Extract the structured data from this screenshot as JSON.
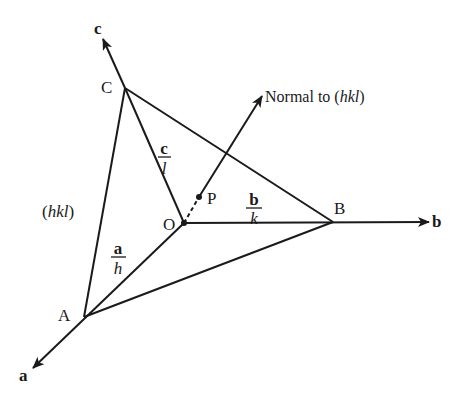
{
  "diagram": {
    "colors": {
      "line": "#1a1a1a",
      "background": "#ffffff"
    },
    "points": {
      "O": {
        "label": "O",
        "x": 184,
        "y": 223
      },
      "A": {
        "label": "A",
        "x": 84,
        "y": 317
      },
      "B": {
        "label": "B",
        "x": 333,
        "y": 222
      },
      "C": {
        "label": "C",
        "x": 125,
        "y": 88
      },
      "P": {
        "label": "P",
        "x": 199,
        "y": 197
      }
    },
    "axes": {
      "a": {
        "label": "a"
      },
      "b": {
        "label": "b"
      },
      "c": {
        "label": "c"
      }
    },
    "intercepts": {
      "a_over_h": {
        "numerator": "a",
        "denominator": "h"
      },
      "b_over_k": {
        "numerator": "b",
        "denominator": "k"
      },
      "c_over_l": {
        "numerator": "c",
        "denominator": "l"
      }
    },
    "plane_label": {
      "open": "(",
      "text": "hkl",
      "close": ")"
    },
    "normal_label": {
      "prefix": "Normal to (",
      "italic": "hkl",
      "suffix": ")"
    }
  }
}
